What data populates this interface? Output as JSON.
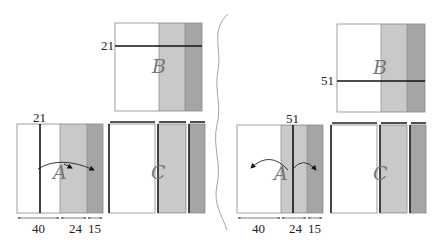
{
  "colors": {
    "white": "#ffffff",
    "light_gray": "#c9c9c9",
    "dark_gray": "#a5a5a5",
    "border": "#888888",
    "line": "#111111",
    "divider": "#999999"
  },
  "panels": [
    {
      "name": "left",
      "block_b": {
        "label": "B",
        "cut_label": "21"
      },
      "block_a": {
        "label": "A",
        "cut_label": "21"
      },
      "block_c": {
        "label": "C"
      },
      "dimensions": [
        "40",
        "24",
        "15"
      ]
    },
    {
      "name": "right",
      "block_b": {
        "label": "B",
        "cut_label": "51"
      },
      "block_a": {
        "label": "A",
        "cut_label": "51"
      },
      "block_c": {
        "label": "C"
      },
      "dimensions": [
        "40",
        "24",
        "15"
      ]
    }
  ]
}
